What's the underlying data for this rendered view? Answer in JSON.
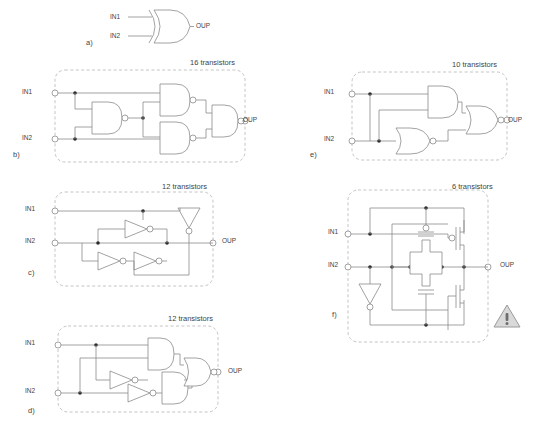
{
  "figure": {
    "background": "#ffffff",
    "line_color": "#8a8a8a",
    "text_color": "#3f3f3f",
    "dashed_border_color": "#b5b5b5",
    "warning_fill": "#d9d9d9"
  },
  "labels": {
    "in1": "IN1",
    "in2": "IN2",
    "out": "OUP"
  },
  "panels": [
    {
      "key": "a",
      "caption": "a)",
      "transistors": "",
      "gate_type": "XOR",
      "description": "Single XOR gate symbol with IN1 and IN2 inputs and OUP output"
    },
    {
      "key": "b",
      "caption": "b)",
      "transistors": "16 transistors",
      "gate_type": "NAND",
      "description": "Four NAND gates forming an XOR"
    },
    {
      "key": "c",
      "caption": "c)",
      "transistors": "12 transistors",
      "gate_type": "INVERTER",
      "description": "Inverter based XOR implementation"
    },
    {
      "key": "d",
      "caption": "d)",
      "transistors": "12 transistors",
      "gate_type": "AND-NOR",
      "description": "Two AND gates, two inverters and a NOR gate"
    },
    {
      "key": "e",
      "caption": "e)",
      "transistors": "10 transistors",
      "gate_type": "AND-OR-NOR",
      "description": "AND gate and OR gate feeding a NOR gate"
    },
    {
      "key": "f",
      "caption": "f)",
      "transistors": "6 transistors",
      "gate_type": "PASS-TRANSISTOR",
      "description": "Transmission gate XOR with inverter and two MOSFETs"
    }
  ],
  "warning_icon": {
    "name": "warning-triangle-icon",
    "glyph": "!"
  }
}
